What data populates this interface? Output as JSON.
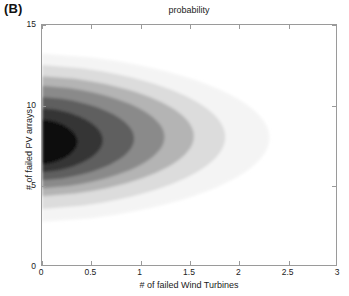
{
  "panel": {
    "label": "(B)"
  },
  "chart_data": {
    "type": "heatmap",
    "title": "probability",
    "xlabel": "# of failed Wind Turbines",
    "ylabel": "# of failed PV arrays",
    "xlim": [
      0,
      3
    ],
    "ylim": [
      0,
      15
    ],
    "xticks": [
      0,
      0.5,
      1,
      1.5,
      2,
      2.5,
      3
    ],
    "xtick_labels": [
      "0",
      "0.5",
      "1",
      "1.5",
      "2",
      "2.5",
      "3"
    ],
    "yticks": [
      0,
      5,
      10,
      15
    ],
    "ytick_labels": [
      "0",
      "5",
      "10",
      "15"
    ],
    "grid": false,
    "legend": "none",
    "colormap": "grayscale-inverted",
    "peak": {
      "x": 0.15,
      "y": 7.5
    },
    "contour_levels": [
      {
        "index": 0,
        "color": "#f4f4f4",
        "label": "lowest",
        "x_extent": [
          0,
          2.32
        ],
        "y_extent": [
          2.7,
          13.2
        ]
      },
      {
        "index": 1,
        "color": "#dcdcdc",
        "label": "low",
        "x_extent": [
          0,
          1.87
        ],
        "y_extent": [
          3.5,
          12.5
        ]
      },
      {
        "index": 2,
        "color": "#b4b4b4",
        "label": "mid-low",
        "x_extent": [
          0,
          1.55
        ],
        "y_extent": [
          4.3,
          11.8
        ]
      },
      {
        "index": 3,
        "color": "#8a8a8a",
        "label": "mid",
        "x_extent": [
          0,
          1.25
        ],
        "y_extent": [
          4.8,
          11.2
        ]
      },
      {
        "index": 4,
        "color": "#5e5e5e",
        "label": "mid-high",
        "x_extent": [
          0,
          0.94
        ],
        "y_extent": [
          5.3,
          10.5
        ]
      },
      {
        "index": 5,
        "color": "#343434",
        "label": "high",
        "x_extent": [
          0,
          0.62
        ],
        "y_extent": [
          5.8,
          9.8
        ]
      },
      {
        "index": 6,
        "color": "#0d0d0d",
        "label": "peak",
        "x_extent": [
          0,
          0.36
        ],
        "y_extent": [
          6.3,
          9.1
        ]
      }
    ],
    "axis_color": "#9a9a9a",
    "background": "#ffffff"
  }
}
